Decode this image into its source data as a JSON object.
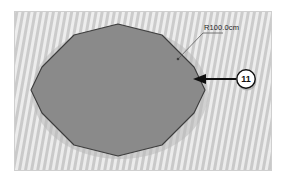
{
  "figure": {
    "panel": {
      "background_color": "#d7d7d7",
      "border_color": "#cfcfcf"
    },
    "shape": {
      "name": "circular-plate",
      "type": "polygon-approximated-circle",
      "fill_color": "#8a8a8a",
      "stroke_color": "#3d3d3d",
      "sides": 12,
      "center": {
        "x": 104,
        "y": 79
      },
      "radius_x": 88,
      "radius_y": 66
    },
    "dimension": {
      "label": "R100.0cm",
      "value": 100.0,
      "unit": "cm",
      "prefix": "R",
      "leader_color": "#5b5b5b",
      "text_color": "#262626"
    },
    "balloon": {
      "label": "11",
      "fill_color": "#ffffff",
      "stroke_color": "#101010",
      "text_color": "#101010",
      "radius": 9
    },
    "arrow": {
      "name": "balloon-leader-arrow",
      "color": "#101010",
      "direction": "left"
    }
  }
}
